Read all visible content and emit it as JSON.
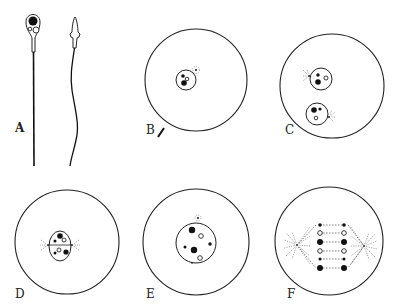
{
  "figure": {
    "panels": [
      {
        "id": "A",
        "label": "A",
        "description": "Two spermatozoa (front and side views)"
      },
      {
        "id": "B",
        "label": "B",
        "description": "Egg with sperm entering; egg nucleus with centrosome"
      },
      {
        "id": "C",
        "label": "C",
        "description": "Male and female pronuclei with centrosomes"
      },
      {
        "id": "D",
        "label": "D",
        "description": "Pronuclei approaching; centrosomes at poles"
      },
      {
        "id": "E",
        "label": "E",
        "description": "Fused nucleus with chromosomes"
      },
      {
        "id": "F",
        "label": "F",
        "description": "Spindle with paired chromosomes and asters"
      }
    ]
  },
  "colors": {
    "background": "#ffffff",
    "ink": "#222222",
    "chromatin": "#111111"
  }
}
